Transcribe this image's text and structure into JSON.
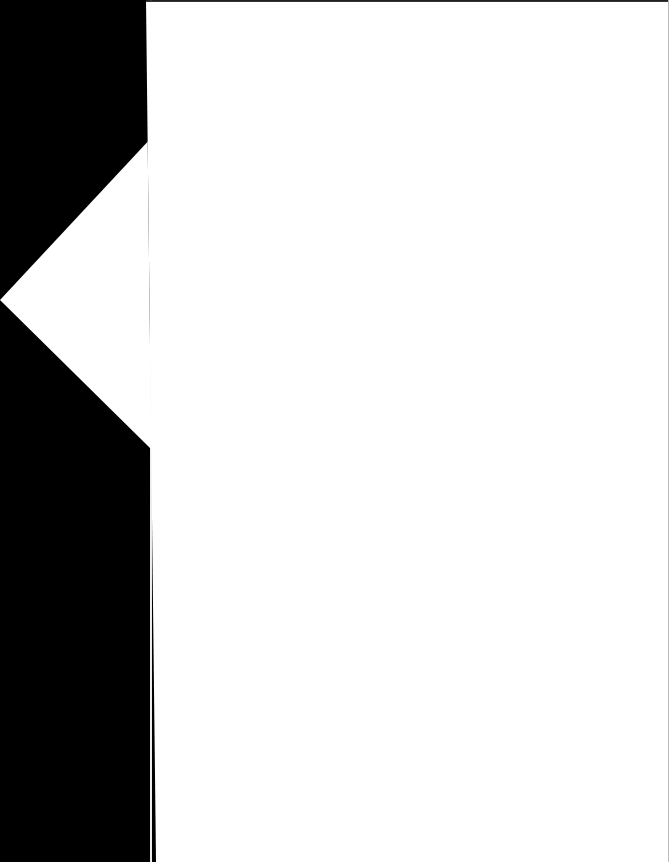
{
  "screen": {
    "width": 669,
    "height": 862,
    "background_color": "#ffffff"
  },
  "nav_rail": {
    "label": "",
    "background_color": "#000000",
    "width": 156,
    "height": 862
  },
  "back_control": {
    "icon": "chevron-left-icon",
    "label": "",
    "accessible_label": "Back",
    "color": "#ffffff",
    "tip_x": 0,
    "tip_y": 300,
    "top_y": 138,
    "bottom_y": 448
  },
  "content": {
    "title": "",
    "body_text": "",
    "background_color": "#ffffff",
    "border_top_color": "#1f1f1f",
    "border_right_color": "#bdbdbd"
  }
}
